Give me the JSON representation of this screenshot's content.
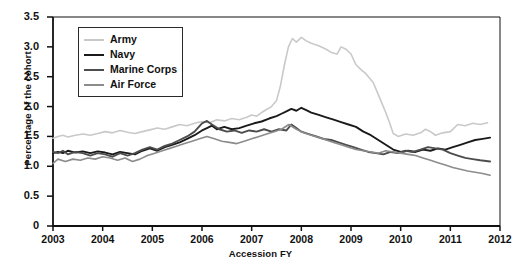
{
  "chart_data": {
    "type": "line",
    "title": "",
    "xlabel": "Accession FY",
    "ylabel": "Percentage of the cohort",
    "xlim": [
      2003,
      2012
    ],
    "ylim": [
      0,
      3.5
    ],
    "ytick_labels": [
      "0",
      "0.5",
      "1.0",
      "1.5",
      "2.0",
      "2.5",
      "3.0",
      "3.5"
    ],
    "ytick_values": [
      0,
      0.5,
      1.0,
      1.5,
      2.0,
      2.5,
      3.0,
      3.5
    ],
    "xtick_labels": [
      "2003",
      "2004",
      "2005",
      "2006",
      "2007",
      "2008",
      "2009",
      "2010",
      "2011",
      "2012"
    ],
    "xtick_values": [
      2003,
      2004,
      2005,
      2006,
      2007,
      2008,
      2009,
      2010,
      2011,
      2012
    ],
    "grid": false,
    "legend_position": "top-left",
    "series": [
      {
        "name": "Army",
        "color": "#c9c9c9",
        "width": 1.6,
        "x": [
          2003.0,
          2003.1,
          2003.2,
          2003.3,
          2003.45,
          2003.6,
          2003.75,
          2003.9,
          2004.05,
          2004.2,
          2004.35,
          2004.5,
          2004.65,
          2004.8,
          2004.95,
          2005.1,
          2005.25,
          2005.4,
          2005.55,
          2005.7,
          2005.85,
          2006.0,
          2006.15,
          2006.3,
          2006.45,
          2006.6,
          2006.75,
          2006.9,
          2007.0,
          2007.1,
          2007.2,
          2007.3,
          2007.4,
          2007.5,
          2007.58,
          2007.66,
          2007.74,
          2007.82,
          2007.9,
          2008.0,
          2008.1,
          2008.2,
          2008.35,
          2008.5,
          2008.62,
          2008.72,
          2008.8,
          2008.9,
          2009.0,
          2009.1,
          2009.2,
          2009.3,
          2009.45,
          2009.6,
          2009.7,
          2009.78,
          2009.85,
          2009.95,
          2010.1,
          2010.25,
          2010.4,
          2010.5,
          2010.6,
          2010.7,
          2010.85,
          2011.0,
          2011.15,
          2011.3,
          2011.45,
          2011.6,
          2011.75
        ],
        "y": [
          1.47,
          1.5,
          1.52,
          1.49,
          1.52,
          1.54,
          1.52,
          1.55,
          1.58,
          1.56,
          1.6,
          1.57,
          1.55,
          1.58,
          1.61,
          1.64,
          1.62,
          1.66,
          1.7,
          1.68,
          1.72,
          1.75,
          1.73,
          1.78,
          1.76,
          1.8,
          1.78,
          1.82,
          1.86,
          1.84,
          1.9,
          1.95,
          2.0,
          2.1,
          2.35,
          2.7,
          3.0,
          3.14,
          3.08,
          3.16,
          3.1,
          3.06,
          3.02,
          2.96,
          2.9,
          2.88,
          3.0,
          2.96,
          2.88,
          2.7,
          2.62,
          2.55,
          2.4,
          2.1,
          1.9,
          1.72,
          1.55,
          1.5,
          1.54,
          1.52,
          1.56,
          1.62,
          1.58,
          1.52,
          1.56,
          1.58,
          1.7,
          1.68,
          1.72,
          1.7,
          1.73
        ]
      },
      {
        "name": "Navy",
        "color": "#1a1a1a",
        "width": 1.9,
        "x": [
          2003.0,
          2003.1,
          2003.2,
          2003.3,
          2003.45,
          2003.6,
          2003.75,
          2003.9,
          2004.05,
          2004.2,
          2004.35,
          2004.5,
          2004.65,
          2004.8,
          2004.95,
          2005.1,
          2005.25,
          2005.4,
          2005.55,
          2005.7,
          2005.85,
          2006.0,
          2006.1,
          2006.2,
          2006.3,
          2006.45,
          2006.6,
          2006.75,
          2006.9,
          2007.05,
          2007.2,
          2007.35,
          2007.5,
          2007.6,
          2007.7,
          2007.8,
          2007.9,
          2008.0,
          2008.1,
          2008.2,
          2008.35,
          2008.5,
          2008.65,
          2008.8,
          2008.95,
          2009.1,
          2009.25,
          2009.4,
          2009.55,
          2009.7,
          2009.85,
          2010.0,
          2010.15,
          2010.3,
          2010.45,
          2010.6,
          2010.75,
          2010.9,
          2011.05,
          2011.2,
          2011.35,
          2011.5,
          2011.65,
          2011.8
        ],
        "y": [
          1.22,
          1.24,
          1.22,
          1.26,
          1.23,
          1.25,
          1.22,
          1.25,
          1.23,
          1.2,
          1.24,
          1.22,
          1.2,
          1.26,
          1.3,
          1.26,
          1.32,
          1.36,
          1.4,
          1.46,
          1.52,
          1.6,
          1.64,
          1.68,
          1.62,
          1.66,
          1.62,
          1.64,
          1.68,
          1.72,
          1.75,
          1.8,
          1.84,
          1.88,
          1.92,
          1.96,
          1.93,
          1.98,
          1.94,
          1.9,
          1.86,
          1.82,
          1.78,
          1.74,
          1.7,
          1.66,
          1.58,
          1.52,
          1.44,
          1.36,
          1.28,
          1.24,
          1.26,
          1.24,
          1.28,
          1.26,
          1.3,
          1.28,
          1.32,
          1.36,
          1.4,
          1.44,
          1.46,
          1.48
        ]
      },
      {
        "name": "Marine Corps",
        "color": "#4d4d4d",
        "width": 1.9,
        "x": [
          2003.0,
          2003.1,
          2003.2,
          2003.3,
          2003.45,
          2003.6,
          2003.75,
          2003.9,
          2004.05,
          2004.2,
          2004.35,
          2004.5,
          2004.65,
          2004.8,
          2004.95,
          2005.1,
          2005.25,
          2005.4,
          2005.55,
          2005.7,
          2005.85,
          2006.0,
          2006.1,
          2006.2,
          2006.35,
          2006.5,
          2006.65,
          2006.8,
          2006.95,
          2007.1,
          2007.25,
          2007.4,
          2007.55,
          2007.7,
          2007.8,
          2007.9,
          2008.0,
          2008.15,
          2008.3,
          2008.45,
          2008.6,
          2008.75,
          2008.9,
          2009.05,
          2009.2,
          2009.35,
          2009.5,
          2009.65,
          2009.8,
          2009.95,
          2010.1,
          2010.25,
          2010.4,
          2010.55,
          2010.7,
          2010.85,
          2011.0,
          2011.15,
          2011.3,
          2011.45,
          2011.6,
          2011.8
        ],
        "y": [
          1.24,
          1.22,
          1.26,
          1.2,
          1.24,
          1.22,
          1.18,
          1.22,
          1.2,
          1.16,
          1.22,
          1.18,
          1.22,
          1.28,
          1.32,
          1.28,
          1.34,
          1.38,
          1.44,
          1.5,
          1.58,
          1.72,
          1.76,
          1.7,
          1.62,
          1.58,
          1.6,
          1.56,
          1.6,
          1.58,
          1.62,
          1.58,
          1.62,
          1.6,
          1.7,
          1.64,
          1.58,
          1.54,
          1.5,
          1.46,
          1.44,
          1.4,
          1.36,
          1.32,
          1.28,
          1.24,
          1.22,
          1.2,
          1.24,
          1.22,
          1.26,
          1.24,
          1.28,
          1.32,
          1.3,
          1.28,
          1.22,
          1.18,
          1.14,
          1.12,
          1.1,
          1.08
        ]
      },
      {
        "name": "Air Force",
        "color": "#8c8c8c",
        "width": 1.6,
        "x": [
          2003.0,
          2003.1,
          2003.25,
          2003.4,
          2003.55,
          2003.7,
          2003.85,
          2004.0,
          2004.15,
          2004.3,
          2004.45,
          2004.6,
          2004.75,
          2004.9,
          2005.05,
          2005.2,
          2005.35,
          2005.5,
          2005.65,
          2005.8,
          2005.95,
          2006.1,
          2006.25,
          2006.4,
          2006.55,
          2006.7,
          2006.85,
          2007.0,
          2007.15,
          2007.3,
          2007.45,
          2007.6,
          2007.75,
          2007.9,
          2008.05,
          2008.2,
          2008.35,
          2008.5,
          2008.65,
          2008.8,
          2008.95,
          2009.1,
          2009.25,
          2009.4,
          2009.55,
          2009.7,
          2009.85,
          2010.0,
          2010.15,
          2010.3,
          2010.45,
          2010.6,
          2010.75,
          2010.9,
          2011.05,
          2011.2,
          2011.35,
          2011.5,
          2011.65,
          2011.8
        ],
        "y": [
          1.05,
          1.12,
          1.08,
          1.12,
          1.1,
          1.14,
          1.12,
          1.16,
          1.14,
          1.1,
          1.14,
          1.08,
          1.12,
          1.18,
          1.22,
          1.26,
          1.3,
          1.34,
          1.38,
          1.42,
          1.46,
          1.5,
          1.46,
          1.42,
          1.4,
          1.38,
          1.42,
          1.46,
          1.5,
          1.54,
          1.58,
          1.62,
          1.7,
          1.62,
          1.56,
          1.52,
          1.48,
          1.44,
          1.4,
          1.36,
          1.32,
          1.28,
          1.26,
          1.24,
          1.22,
          1.26,
          1.24,
          1.22,
          1.2,
          1.18,
          1.14,
          1.1,
          1.06,
          1.02,
          0.98,
          0.95,
          0.92,
          0.9,
          0.88,
          0.85
        ]
      }
    ]
  },
  "legend": {
    "items": [
      {
        "label": "Army"
      },
      {
        "label": "Navy"
      },
      {
        "label": "Marine Corps"
      },
      {
        "label": "Air Force"
      }
    ]
  }
}
